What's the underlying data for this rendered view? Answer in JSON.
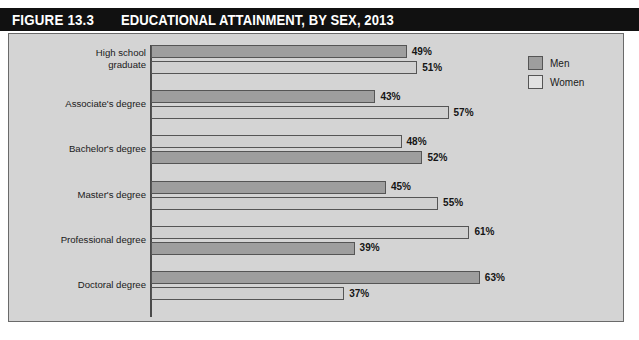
{
  "figure": {
    "number": "FIGURE 13.3",
    "title": "EDUCATIONAL ATTAINMENT, BY SEX, 2013"
  },
  "legend": {
    "items": [
      {
        "label": "Men",
        "color": "#9e9e9e"
      },
      {
        "label": "Women",
        "color": "#e2e2e2"
      }
    ]
  },
  "chart_data": {
    "type": "bar",
    "orientation": "horizontal",
    "title": "EDUCATIONAL ATTAINMENT, BY SEX, 2013",
    "xlabel": "",
    "ylabel": "",
    "xlim": [
      0,
      70
    ],
    "grid": false,
    "legend_position": "top-right",
    "categories": [
      "High school\ngraduate",
      "Associate's degree",
      "Bachelor's degree",
      "Master's degree",
      "Professional degree",
      "Doctoral degree"
    ],
    "series": [
      {
        "name": "Men",
        "values": [
          49,
          43,
          48,
          45,
          61,
          63
        ],
        "labels": [
          "49%",
          "43%",
          "48%",
          "45%",
          "61%",
          "63%"
        ]
      },
      {
        "name": "Women",
        "values": [
          51,
          57,
          52,
          55,
          39,
          37
        ],
        "labels": [
          "51%",
          "57%",
          "52%",
          "55%",
          "39%",
          "37%"
        ]
      }
    ]
  }
}
